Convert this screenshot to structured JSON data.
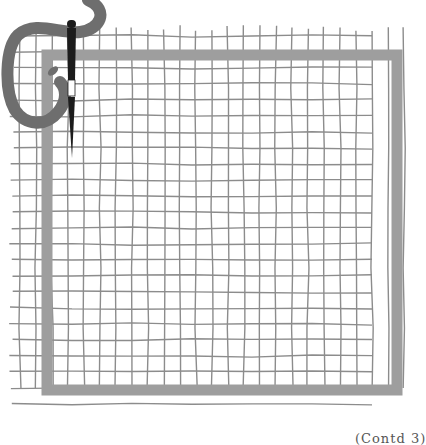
{
  "illustration": {
    "subject": "needlepoint-canvas-with-needle-and-yarn",
    "grid": {
      "x_start": 12,
      "x_end": 410,
      "y_start": 28,
      "y_end": 412,
      "cell": 16,
      "line_color": "#8c8c8c"
    },
    "border": {
      "x": 47,
      "y": 55,
      "width": 350,
      "height": 335,
      "thickness": 11,
      "color": "#9e9e9e"
    },
    "yarn": {
      "color": "#6e6e6e"
    },
    "needle": {
      "color": "#1c1c1c",
      "eye_color": "#ffffff"
    }
  },
  "caption": "(Contd 3)"
}
